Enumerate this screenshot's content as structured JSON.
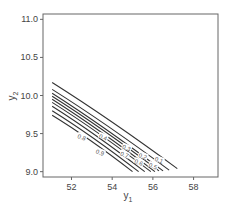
{
  "chart_data": {
    "type": "contour",
    "title": "",
    "xlabel": "y",
    "xlabel_sub": "1",
    "ylabel": "y",
    "ylabel_sub": "2",
    "xlim": [
      50.6,
      59.2
    ],
    "ylim": [
      8.93,
      11.07
    ],
    "xticks": [
      52,
      54,
      56,
      58
    ],
    "yticks": [
      9.0,
      9.5,
      10.0,
      10.5,
      11.0
    ],
    "xtick_labels": [
      "52",
      "54",
      "56",
      "58"
    ],
    "ytick_labels": [
      "9.0",
      "9.5",
      "10.0",
      "10.5",
      "11.0"
    ],
    "grid": false,
    "legend": null,
    "line_color": "#333333",
    "contours": [
      {
        "level": 0.1,
        "label": "0.1",
        "start": [
          51.05,
          10.17
        ],
        "end": [
          57.2,
          9.04
        ],
        "label_at": [
          56.3,
          9.15
        ]
      },
      {
        "level": 0.2,
        "label": "0.2",
        "start": [
          51.05,
          10.08
        ],
        "end": [
          56.8,
          9.02
        ],
        "label_at": [
          55.5,
          9.2
        ]
      },
      {
        "level": 0.3,
        "label": "0.3",
        "start": [
          51.05,
          10.03
        ],
        "end": [
          56.5,
          9.01
        ],
        "label_at": [
          54.7,
          9.31
        ]
      },
      {
        "level": 0.4,
        "label": "0.4",
        "start": [
          51.05,
          9.99
        ],
        "end": [
          56.3,
          9.01
        ],
        "label_at": [
          53.55,
          9.45
        ]
      },
      {
        "level": 0.5,
        "label": "0.5",
        "start": [
          51.05,
          9.95
        ],
        "end": [
          56.1,
          9.0
        ],
        "label_at": [
          56.0,
          9.07
        ]
      },
      {
        "level": 0.6,
        "label": "0.6",
        "start": [
          51.05,
          9.91
        ],
        "end": [
          55.9,
          9.0
        ],
        "label_at": [
          55.3,
          9.12
        ]
      },
      {
        "level": 0.7,
        "label": "0.7",
        "start": [
          51.05,
          9.86
        ],
        "end": [
          55.6,
          9.0
        ],
        "label_at": [
          54.6,
          9.22
        ]
      },
      {
        "level": 0.8,
        "label": "0.8",
        "start": [
          51.05,
          9.8
        ],
        "end": [
          55.3,
          9.0
        ],
        "label_at": [
          52.5,
          9.45
        ]
      },
      {
        "level": 0.9,
        "label": "0.9",
        "start": [
          51.05,
          9.74
        ],
        "end": [
          55.0,
          9.0
        ],
        "label_at": [
          53.4,
          9.25
        ]
      }
    ]
  }
}
